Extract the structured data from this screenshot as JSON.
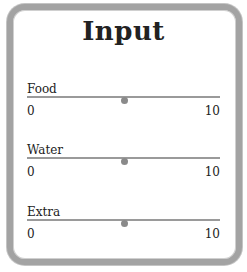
{
  "title": "Input",
  "sliders": [
    {
      "label": "Food",
      "min": "0",
      "max": "10",
      "value": 5
    },
    {
      "label": "Water",
      "min": "0",
      "max": "10",
      "value": 5
    },
    {
      "label": "Extra",
      "min": "0",
      "max": "10",
      "value": 5
    }
  ],
  "colors": {
    "frame": "#a3a3a3",
    "track": "#9a9a9a",
    "thumb": "#8a8a8a"
  }
}
